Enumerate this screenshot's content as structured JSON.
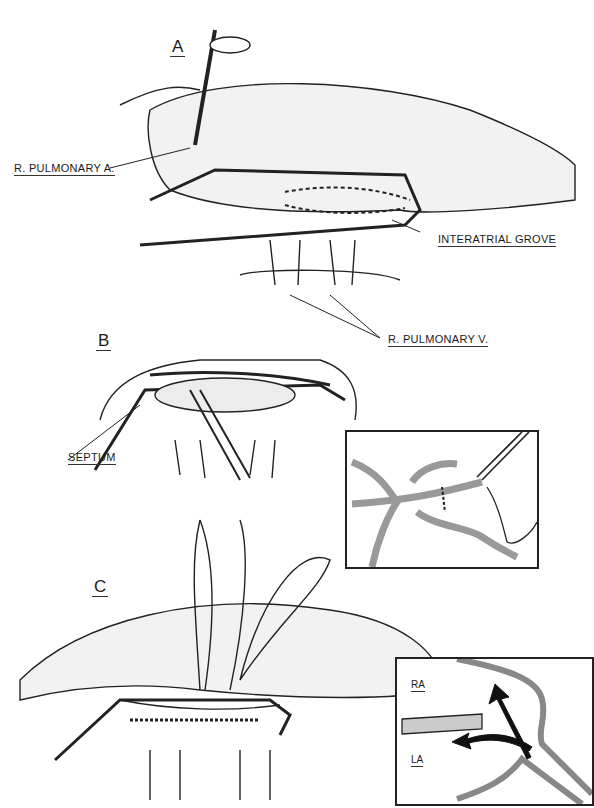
{
  "header": {
    "text": ""
  },
  "panels": {
    "A": {
      "letter": "A"
    },
    "B": {
      "letter": "B"
    },
    "C": {
      "letter": "C"
    }
  },
  "labels": {
    "r_pulmonary_a": "R. PULMONARY A.",
    "interatrial_grove": "INTERATRIAL GROVE",
    "r_pulmonary_v": "R. PULMONARY V.",
    "septum": "SEPTUM"
  },
  "inset_bottom": {
    "ra": "RA",
    "la": "LA"
  }
}
